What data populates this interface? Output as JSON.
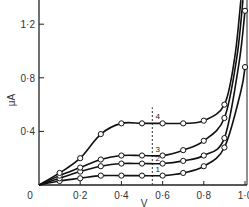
{
  "chart_data": {
    "type": "line",
    "title": "",
    "xlabel": "V",
    "ylabel": "μA",
    "xlim": [
      0,
      1.0
    ],
    "ylim": [
      0,
      1.38
    ],
    "grid": false,
    "legend": "inline curve numbers 1-4",
    "x_ticks": [
      "0",
      "0·2",
      "0·4",
      "0·6",
      "0·8",
      "1·0"
    ],
    "y_ticks": [
      "0·4",
      "0·8",
      "1·2"
    ],
    "origin_label": "0",
    "annotations": [
      {
        "type": "vertical-dashed-line",
        "x": 0.55
      }
    ],
    "series": [
      {
        "name": "1",
        "x": [
          0,
          0.1,
          0.2,
          0.3,
          0.4,
          0.5,
          0.6,
          0.7,
          0.8,
          0.9,
          0.98,
          1.0
        ],
        "y": [
          0,
          0.03,
          0.05,
          0.07,
          0.07,
          0.07,
          0.07,
          0.09,
          0.14,
          0.28,
          0.7,
          0.88
        ]
      },
      {
        "name": "2",
        "x": [
          0,
          0.1,
          0.2,
          0.3,
          0.4,
          0.5,
          0.6,
          0.7,
          0.8,
          0.9,
          0.97,
          1.0
        ],
        "y": [
          0,
          0.05,
          0.1,
          0.14,
          0.16,
          0.16,
          0.16,
          0.18,
          0.22,
          0.35,
          0.9,
          1.3
        ]
      },
      {
        "name": "3",
        "x": [
          0,
          0.1,
          0.2,
          0.3,
          0.4,
          0.5,
          0.6,
          0.7,
          0.8,
          0.9,
          0.96,
          0.99
        ],
        "y": [
          0,
          0.07,
          0.13,
          0.19,
          0.22,
          0.22,
          0.22,
          0.26,
          0.33,
          0.5,
          0.95,
          1.38
        ]
      },
      {
        "name": "4",
        "x": [
          0,
          0.1,
          0.2,
          0.3,
          0.4,
          0.5,
          0.6,
          0.7,
          0.8,
          0.9,
          0.95,
          0.98
        ],
        "y": [
          0,
          0.09,
          0.2,
          0.38,
          0.46,
          0.46,
          0.46,
          0.46,
          0.48,
          0.6,
          0.95,
          1.38
        ]
      }
    ],
    "marker_indices": {
      "1": [
        1,
        2,
        3,
        4,
        5,
        6,
        7,
        8,
        9,
        11
      ],
      "2": [
        1,
        2,
        3,
        4,
        5,
        6,
        7,
        8,
        9,
        11
      ],
      "3": [
        1,
        2,
        3,
        4,
        5,
        6,
        7,
        8,
        9
      ],
      "4": [
        1,
        2,
        3,
        4,
        5,
        6,
        7,
        8,
        9
      ]
    },
    "curve_label_positions": {
      "1": [
        0.565,
        0.1
      ],
      "2": [
        0.565,
        0.18
      ],
      "3": [
        0.565,
        0.25
      ],
      "4": [
        0.565,
        0.49
      ]
    }
  }
}
